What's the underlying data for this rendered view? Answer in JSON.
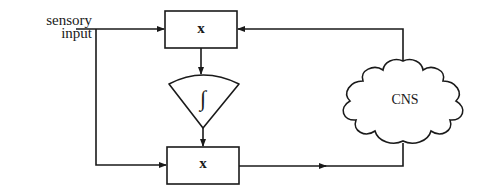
{
  "diagram": {
    "input_label": "sensory\ninput",
    "input_label_line1": "sensory",
    "input_label_line2": "input",
    "top_multiplier_label": "x",
    "bottom_multiplier_label": "x",
    "integrator_symbol": "∫",
    "cns_label": "CNS",
    "colors": {
      "line": "#1a1a1a",
      "background": "#ffffff"
    },
    "nodes": [
      {
        "id": "top-multiplier",
        "type": "box",
        "label": "x"
      },
      {
        "id": "integrator",
        "type": "fan",
        "label": "∫"
      },
      {
        "id": "bottom-multiplier",
        "type": "box",
        "label": "x"
      },
      {
        "id": "cns",
        "type": "cloud",
        "label": "CNS"
      }
    ],
    "edges": [
      {
        "from": "sensory input",
        "to": "top-multiplier"
      },
      {
        "from": "sensory input",
        "to": "bottom-multiplier"
      },
      {
        "from": "top-multiplier",
        "to": "integrator"
      },
      {
        "from": "integrator",
        "to": "bottom-multiplier"
      },
      {
        "from": "bottom-multiplier",
        "to": "cns"
      },
      {
        "from": "cns",
        "to": "top-multiplier"
      }
    ]
  }
}
